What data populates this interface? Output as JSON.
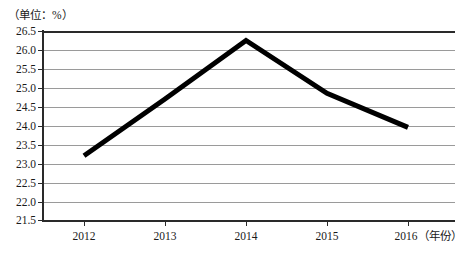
{
  "chart_data": {
    "type": "line",
    "title": "",
    "unit_label": "（单位：%）",
    "xlabel": "（年份）",
    "ylabel": "",
    "categories": [
      "2012",
      "2013",
      "2014",
      "2015",
      "2016"
    ],
    "values": [
      23.2,
      24.7,
      26.25,
      24.85,
      23.95
    ],
    "series": [
      {
        "name": "",
        "values": [
          23.2,
          24.7,
          26.25,
          24.85,
          23.95
        ]
      }
    ],
    "ylim": [
      21.5,
      26.5
    ],
    "ytick_step": 0.5,
    "yticks": [
      "26.5",
      "26.0",
      "25.5",
      "25.0",
      "24.5",
      "24.0",
      "23.5",
      "23.0",
      "22.5",
      "22.0",
      "21.5"
    ],
    "xticks": [
      "2012",
      "2013",
      "2014",
      "2015",
      "2016"
    ],
    "xtick_labels": [
      "2012",
      "2013",
      "2014",
      "2015",
      "2016（年份）"
    ],
    "grid": true,
    "grid_axis": "y",
    "legend": false,
    "legend_position": "none",
    "markers": false,
    "line_color": "#000000",
    "line_width_px": 5,
    "grid_color": "#9a9a9a",
    "axis_color": "#2a2a2a",
    "background": "#ffffff"
  }
}
